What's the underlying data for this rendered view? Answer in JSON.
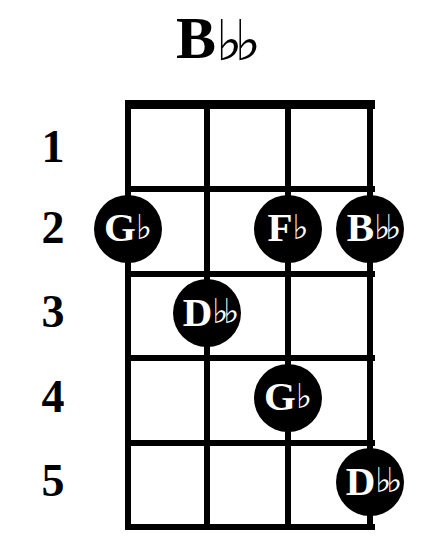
{
  "title": {
    "root": "B",
    "accidental": "♭♭",
    "full": "B♭♭"
  },
  "diagram": {
    "type": "chord-diagram",
    "instrument_strings": 4,
    "frets_shown": 5,
    "nut_visible": true,
    "background_color": "#ffffff",
    "ink_color": "#000000",
    "dot_text_color": "#ffffff",
    "fret_numbers": [
      "1",
      "2",
      "3",
      "4",
      "5"
    ],
    "string_indices": [
      1,
      2,
      3,
      4
    ],
    "notes": [
      {
        "string": 1,
        "fret": 2,
        "letter": "G",
        "accidental": "♭",
        "label": "G♭",
        "double": false
      },
      {
        "string": 3,
        "fret": 2,
        "letter": "F",
        "accidental": "♭",
        "label": "F♭",
        "double": false
      },
      {
        "string": 4,
        "fret": 2,
        "letter": "B",
        "accidental": "♭♭",
        "label": "B♭♭",
        "double": true
      },
      {
        "string": 2,
        "fret": 3,
        "letter": "D",
        "accidental": "♭♭",
        "label": "D♭♭",
        "double": true
      },
      {
        "string": 3,
        "fret": 4,
        "letter": "G",
        "accidental": "♭",
        "label": "G♭",
        "double": false
      },
      {
        "string": 4,
        "fret": 5,
        "letter": "D",
        "accidental": "♭♭",
        "label": "D♭♭",
        "double": true
      }
    ]
  },
  "geometry": {
    "grid_left": 125,
    "grid_right": 375,
    "grid_top": 100,
    "nut_height": 9,
    "fret_spacing": 84.8,
    "string_x": [
      128,
      207,
      288,
      370
    ],
    "fret_line_y": [
      186,
      271,
      355,
      440,
      524
    ],
    "label_x": 22,
    "dot_diameter": 68
  }
}
